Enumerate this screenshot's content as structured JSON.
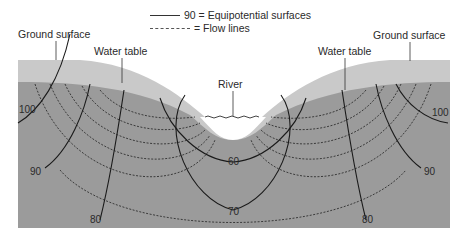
{
  "legend": {
    "equipotential_value": "90",
    "equipotential_label": "= Equipotential surfaces",
    "flow_label": "= Flow lines"
  },
  "labels": {
    "ground_surface_left": "Ground surface",
    "ground_surface_right": "Ground surface",
    "water_table_left": "Water table",
    "water_table_right": "Water table",
    "river": "River"
  },
  "equipotential_values": {
    "left_100": "100",
    "left_90": "90",
    "left_80": "80",
    "center_60": "60",
    "center_70": "70",
    "right_80": "80",
    "right_90": "90",
    "right_100": "100"
  },
  "colors": {
    "unsaturated_zone": "#c8c8c8",
    "saturated_zone": "#9a9a9a",
    "line": "#1a1a1a"
  }
}
